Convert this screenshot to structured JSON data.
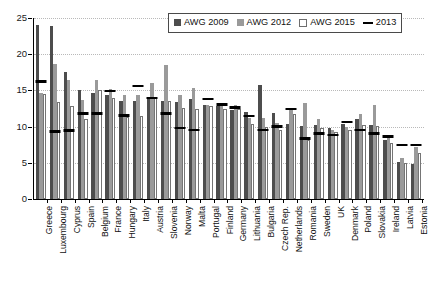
{
  "chart_data": {
    "type": "bar",
    "title": "",
    "xlabel": "",
    "ylabel": "",
    "ylim": [
      0,
      25
    ],
    "yticks": [
      0,
      5,
      10,
      15,
      20,
      25
    ],
    "grid": true,
    "legend_position": "top-center",
    "categories": [
      "Greece",
      "Luxembourg",
      "Cyprus",
      "Spain",
      "Belgium",
      "France",
      "Hungary",
      "Italy",
      "Austria",
      "Slovenia",
      "Norway",
      "Malta",
      "Portugal",
      "Finland",
      "Germany",
      "Lithuania",
      "Bulgaria",
      "Czech Rep.",
      "Netherlands",
      "Romania",
      "Sweden",
      "UK",
      "Denmark",
      "Poland",
      "Slovakia",
      "Ireland",
      "Latvia",
      "Estonia"
    ],
    "series": [
      {
        "name": "AWG 2009",
        "color": "#4d4d4d",
        "values": [
          24.1,
          23.9,
          17.6,
          15.1,
          14.7,
          14.4,
          13.6,
          13.6,
          13.8,
          13.5,
          13.4,
          13.8,
          13.0,
          12.9,
          12.3,
          12.0,
          15.8,
          11.9,
          10.4,
          10.1,
          10.2,
          9.8,
          10.4,
          11.0,
          10.2,
          8.1,
          5.1,
          4.9
        ]
      },
      {
        "name": "AWG 2012",
        "color": "#9a9a9a",
        "values": [
          14.6,
          18.6,
          16.4,
          13.7,
          16.5,
          15.2,
          14.3,
          14.3,
          16.0,
          18.5,
          14.3,
          15.3,
          13.0,
          13.1,
          13.0,
          11.2,
          11.2,
          10.5,
          12.6,
          13.3,
          11.0,
          9.5,
          9.9,
          11.7,
          13.0,
          8.8,
          5.6,
          7.2
        ]
      },
      {
        "name": "AWG 2015",
        "color": "#ffffff",
        "values": [
          14.5,
          13.4,
          12.8,
          11.0,
          15.1,
          14.0,
          11.3,
          11.5,
          14.0,
          13.5,
          12.6,
          12.4,
          12.8,
          12.5,
          12.4,
          10.4,
          10.0,
          9.6,
          11.8,
          8.2,
          9.8,
          9.2,
          9.6,
          10.2,
          10.1,
          7.8,
          5.0,
          6.4
        ]
      }
    ],
    "marker_series": {
      "name": "2013",
      "color": "#000000",
      "style": "horizontal-dash",
      "values": [
        16.2,
        9.3,
        9.4,
        11.8,
        11.8,
        14.9,
        11.5,
        15.6,
        13.9,
        11.8,
        9.8,
        9.5,
        13.8,
        13.0,
        12.6,
        11.4,
        9.5,
        10.0,
        12.4,
        8.3,
        9.0,
        8.8,
        10.6,
        9.5,
        9.0,
        8.6,
        7.4,
        7.4
      ]
    }
  },
  "legend": {
    "items": [
      {
        "label": "AWG 2009",
        "swatch": "dark-gray-square"
      },
      {
        "label": "AWG 2012",
        "swatch": "medium-gray-square"
      },
      {
        "label": "AWG 2015",
        "swatch": "white-square"
      },
      {
        "label": "2013",
        "swatch": "black-line"
      }
    ]
  }
}
